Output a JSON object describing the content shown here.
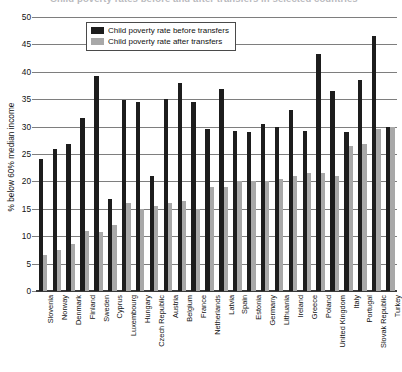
{
  "title_strip": "Child poverty rates before and after transfers in selected countries",
  "legend": {
    "position": "top-left-inside",
    "items": [
      {
        "label": "Child poverty rate before transfers",
        "color": "#1d1d1d",
        "key": "before"
      },
      {
        "label": "Child poverty rate after transfers",
        "color": "#a8a8a8",
        "key": "after"
      }
    ]
  },
  "axes": {
    "ylabel": "% below 60% median income",
    "xlabel": "",
    "yticks": [
      0,
      5,
      10,
      15,
      20,
      25,
      30,
      35,
      40,
      45,
      50
    ],
    "ylim": [
      0,
      50
    ],
    "grid": "horizontal"
  },
  "chart_data": {
    "type": "bar",
    "title": "Child poverty rates before and after transfers in selected countries",
    "xlabel": "",
    "ylabel": "% below 60% median income",
    "ylim": [
      0,
      50
    ],
    "grid": true,
    "legend_position": "upper left",
    "categories": [
      "Slovenia",
      "Norway",
      "Denmark",
      "Finland",
      "Sweden",
      "Cyprus",
      "Luxembourg",
      "Hungary",
      "Czech Republic",
      "Austria",
      "Belgium",
      "France",
      "Netherlands",
      "Latvia",
      "Spain",
      "Estonia",
      "Germany",
      "Lithuania",
      "Ireland",
      "Greece",
      "Poland",
      "United Kingdom",
      "Italy",
      "Portugal",
      "Slovak Republic",
      "Turkey"
    ],
    "series": [
      {
        "name": "Child poverty rate before transfers",
        "color": "#1d1d1d",
        "values": [
          24.0,
          26.0,
          26.8,
          31.5,
          39.3,
          16.8,
          34.8,
          34.5,
          21.0,
          35.0,
          38.0,
          34.5,
          29.5,
          36.8,
          29.2,
          29.0,
          30.5,
          30.0,
          33.0,
          29.2,
          43.3,
          36.5,
          29.0,
          38.5,
          46.5,
          30.0
        ]
      },
      {
        "name": "Child poverty rate after transfers",
        "color": "#a8a8a8",
        "values": [
          6.5,
          7.5,
          8.5,
          11.0,
          10.8,
          12.0,
          16.0,
          15.0,
          15.5,
          16.0,
          16.5,
          15.0,
          19.0,
          19.0,
          20.0,
          20.0,
          20.0,
          20.5,
          21.0,
          21.5,
          21.5,
          21.0,
          26.5,
          26.8,
          29.5,
          30.0
        ]
      }
    ]
  }
}
